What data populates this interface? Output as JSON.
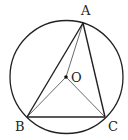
{
  "diagram": {
    "type": "geometry",
    "circle": {
      "center": "O",
      "cx": 66.5,
      "cy": 77,
      "r": 56.5
    },
    "points": {
      "A": {
        "label": "A",
        "x": 83,
        "y": 23,
        "lx": 81,
        "ly": 15
      },
      "B": {
        "label": "B",
        "x": 27,
        "y": 117,
        "lx": 15,
        "ly": 131
      },
      "C": {
        "label": "C",
        "x": 105,
        "y": 117,
        "lx": 108,
        "ly": 131
      },
      "O": {
        "label": "O",
        "x": 66,
        "y": 77,
        "lx": 71,
        "ly": 82
      }
    },
    "segments": [
      {
        "from": "A",
        "to": "B",
        "weight": "bold"
      },
      {
        "from": "B",
        "to": "C",
        "weight": "bold"
      },
      {
        "from": "C",
        "to": "A",
        "weight": "bold"
      },
      {
        "from": "O",
        "to": "A",
        "weight": "thin"
      },
      {
        "from": "O",
        "to": "B",
        "weight": "thin"
      },
      {
        "from": "O",
        "to": "C",
        "weight": "thin"
      }
    ],
    "colors": {
      "stroke": "#222222",
      "background": "#ffffff"
    }
  }
}
